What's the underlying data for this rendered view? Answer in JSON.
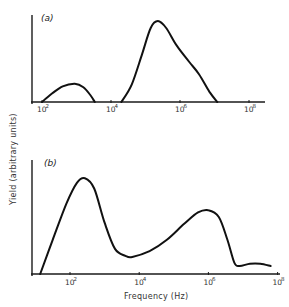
{
  "chart_data": [
    {
      "type": "line",
      "panel_label": "(a)",
      "xscale": "log",
      "xlim_log10": [
        1.71,
        8.2
      ],
      "ylim": [
        0,
        1
      ],
      "x_ticks": [
        {
          "base": "10",
          "exp": "2",
          "log10": 2
        },
        {
          "base": "10",
          "exp": "4",
          "log10": 4
        },
        {
          "base": "10",
          "exp": "6",
          "log10": 6
        },
        {
          "base": "10",
          "exp": "8",
          "log10": 8
        }
      ],
      "series": [
        {
          "name": "yield-a-low",
          "points_log10x_y": [
            [
              2.0,
              0.0
            ],
            [
              2.3,
              0.1
            ],
            [
              2.6,
              0.18
            ],
            [
              2.95,
              0.21
            ],
            [
              3.2,
              0.17
            ],
            [
              3.4,
              0.08
            ],
            [
              3.53,
              0.0
            ]
          ]
        },
        {
          "name": "yield-a-high",
          "points_log10x_y": [
            [
              4.3,
              0.0
            ],
            [
              4.6,
              0.2
            ],
            [
              4.9,
              0.55
            ],
            [
              5.15,
              0.85
            ],
            [
              5.36,
              0.93
            ],
            [
              5.6,
              0.85
            ],
            [
              5.9,
              0.65
            ],
            [
              6.27,
              0.46
            ],
            [
              6.55,
              0.32
            ],
            [
              6.85,
              0.12
            ],
            [
              7.08,
              0.0
            ]
          ]
        }
      ],
      "grid": false
    },
    {
      "type": "line",
      "panel_label": "(b)",
      "xscale": "log",
      "xlim_log10": [
        0.9,
        8.0
      ],
      "ylim": [
        0,
        1
      ],
      "xlabel": "Frequency (Hz)",
      "x_ticks": [
        {
          "base": "10",
          "exp": "2",
          "log10": 2
        },
        {
          "base": "10",
          "exp": "4",
          "log10": 4
        },
        {
          "base": "10",
          "exp": "6",
          "log10": 6
        },
        {
          "base": "10",
          "exp": "8",
          "log10": 8
        }
      ],
      "series": [
        {
          "name": "yield-b",
          "points_log10x_y": [
            [
              1.14,
              0.0
            ],
            [
              1.5,
              0.3
            ],
            [
              1.9,
              0.62
            ],
            [
              2.2,
              0.8
            ],
            [
              2.43,
              0.84
            ],
            [
              2.7,
              0.75
            ],
            [
              3.0,
              0.45
            ],
            [
              3.3,
              0.22
            ],
            [
              3.6,
              0.16
            ],
            [
              3.8,
              0.15
            ],
            [
              4.3,
              0.2
            ],
            [
              4.8,
              0.3
            ],
            [
              5.3,
              0.44
            ],
            [
              5.7,
              0.54
            ],
            [
              6.0,
              0.56
            ],
            [
              6.3,
              0.5
            ],
            [
              6.55,
              0.3
            ],
            [
              6.75,
              0.1
            ],
            [
              6.9,
              0.07
            ],
            [
              7.2,
              0.09
            ],
            [
              7.5,
              0.09
            ],
            [
              7.8,
              0.07
            ]
          ]
        }
      ],
      "grid": false
    }
  ],
  "labels": {
    "ylabel": "Yield (arbitrary units)",
    "xlabel": "Frequency (Hz)",
    "panel_a": "(a)",
    "panel_b": "(b)"
  }
}
